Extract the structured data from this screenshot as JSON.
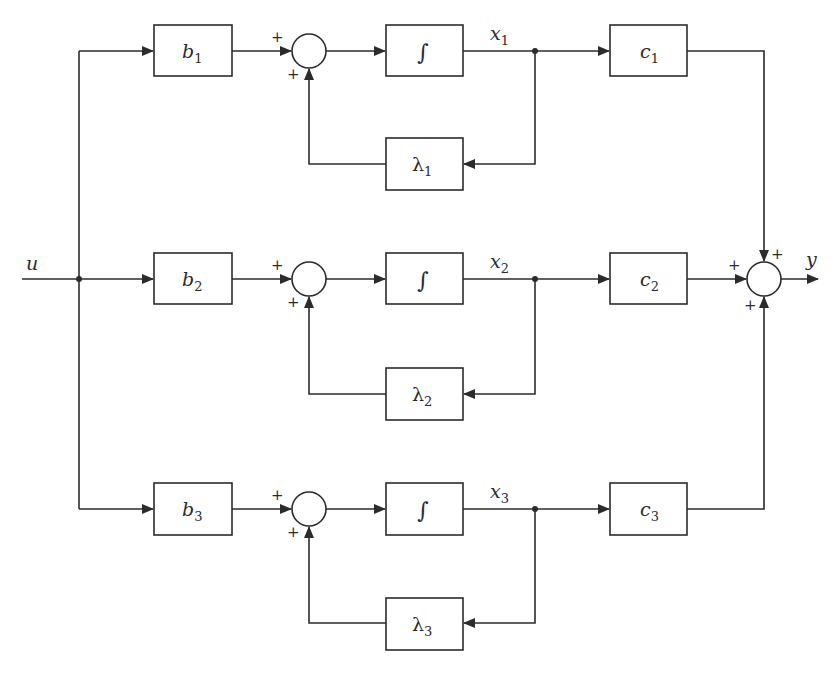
{
  "diagram": {
    "type": "block-diagram",
    "input": {
      "label": "u"
    },
    "output": {
      "label": "y"
    },
    "rows": [
      {
        "input_gain": {
          "name": "b",
          "sub": "1"
        },
        "sum_signs": {
          "top": "+",
          "bottom": "+"
        },
        "integrator": {
          "symbol": "∫"
        },
        "state": {
          "name": "x",
          "sub": "1"
        },
        "feedback_gain": {
          "name": "λ",
          "sub": "1"
        },
        "output_gain": {
          "name": "c",
          "sub": "1"
        }
      },
      {
        "input_gain": {
          "name": "b",
          "sub": "2"
        },
        "sum_signs": {
          "top": "+",
          "bottom": "+"
        },
        "integrator": {
          "symbol": "∫"
        },
        "state": {
          "name": "x",
          "sub": "2"
        },
        "feedback_gain": {
          "name": "λ",
          "sub": "2"
        },
        "output_gain": {
          "name": "c",
          "sub": "2"
        }
      },
      {
        "input_gain": {
          "name": "b",
          "sub": "3"
        },
        "sum_signs": {
          "top": "+",
          "bottom": "+"
        },
        "integrator": {
          "symbol": "∫"
        },
        "state": {
          "name": "x",
          "sub": "3"
        },
        "feedback_gain": {
          "name": "λ",
          "sub": "3"
        },
        "output_gain": {
          "name": "c",
          "sub": "3"
        }
      }
    ],
    "output_sum_signs": {
      "top": "+",
      "left": "+",
      "bottom": "+"
    }
  }
}
